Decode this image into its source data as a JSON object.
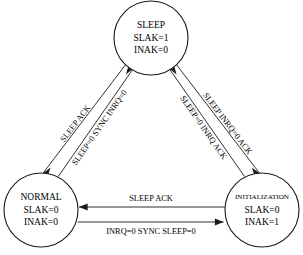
{
  "diagram": {
    "type": "state-transition-diagram",
    "nodes": [
      {
        "id": "sleep",
        "name": "SLEEP",
        "attrs": [
          "SLAK=1",
          "INAK=0"
        ],
        "cx": 151,
        "cy": 38,
        "r": 37
      },
      {
        "id": "normal",
        "name": "NORMAL",
        "attrs": [
          "SLAK=0",
          "INAK=0"
        ],
        "cx": 41,
        "cy": 210,
        "r": 37
      },
      {
        "id": "initialization",
        "name": "INITIALIZATION",
        "attrs": [
          "SLAK=0",
          "INAK=1"
        ],
        "cx": 262,
        "cy": 210,
        "r": 37
      }
    ],
    "edges": [
      {
        "id": "normal-to-sleep",
        "label": "SLEEP=0 SYNC INRQ=0",
        "from": "normal",
        "to": "sleep"
      },
      {
        "id": "sleep-to-normal",
        "label": "SLEEP ACK",
        "from": "sleep",
        "to": "normal"
      },
      {
        "id": "initialization-to-sleep",
        "label": "SLEEP INRQ=0 ACK",
        "from": "initialization",
        "to": "sleep"
      },
      {
        "id": "sleep-to-initialization",
        "label": "SLEEP=0 INRQ ACK",
        "from": "sleep",
        "to": "initialization"
      },
      {
        "id": "initialization-to-normal",
        "label": "SLEEP ACK",
        "from": "initialization",
        "to": "normal"
      },
      {
        "id": "normal-to-initialization",
        "label": "INRQ=0 SYNC SLEEP=0",
        "from": "normal",
        "to": "initialization"
      }
    ]
  }
}
